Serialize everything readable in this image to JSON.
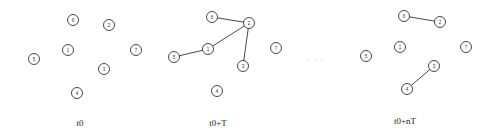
{
  "diagram": {
    "ellipsis": "· · ·",
    "ellipsis_pos": [
      316,
      61
    ],
    "node_radius": 5.5,
    "colors": {
      "stroke": "#333333",
      "fill": "#ffffff",
      "text": "#222222"
    },
    "panels": [
      {
        "label": "t0",
        "label_pos": [
          80,
          126
        ],
        "nodes": [
          {
            "id": "1",
            "x": 68,
            "y": 50
          },
          {
            "id": "2",
            "x": 109,
            "y": 25
          },
          {
            "id": "3",
            "x": 104,
            "y": 69
          },
          {
            "id": "4",
            "x": 77,
            "y": 93
          },
          {
            "id": "5",
            "x": 34,
            "y": 59
          },
          {
            "id": "6",
            "x": 73,
            "y": 20
          },
          {
            "id": "7",
            "x": 136,
            "y": 50
          }
        ],
        "edges": []
      },
      {
        "label": "t0+T",
        "label_pos": [
          218,
          126
        ],
        "nodes": [
          {
            "id": "1",
            "x": 208,
            "y": 49
          },
          {
            "id": "2",
            "x": 249,
            "y": 23
          },
          {
            "id": "3",
            "x": 243,
            "y": 66
          },
          {
            "id": "4",
            "x": 217,
            "y": 91
          },
          {
            "id": "5",
            "x": 174,
            "y": 57
          },
          {
            "id": "6",
            "x": 212,
            "y": 17
          },
          {
            "id": "7",
            "x": 276,
            "y": 48
          }
        ],
        "edges": [
          [
            "6",
            "2"
          ],
          [
            "2",
            "1"
          ],
          [
            "1",
            "5"
          ],
          [
            "2",
            "3"
          ]
        ]
      },
      {
        "label": "t0+nT",
        "label_pos": [
          405,
          124
        ],
        "nodes": [
          {
            "id": "1",
            "x": 400,
            "y": 47
          },
          {
            "id": "2",
            "x": 440,
            "y": 22
          },
          {
            "id": "3",
            "x": 434,
            "y": 66
          },
          {
            "id": "4",
            "x": 407,
            "y": 89
          },
          {
            "id": "5",
            "x": 366,
            "y": 56
          },
          {
            "id": "6",
            "x": 404,
            "y": 16
          },
          {
            "id": "7",
            "x": 466,
            "y": 47
          }
        ],
        "edges": [
          [
            "6",
            "2"
          ],
          [
            "3",
            "4"
          ]
        ]
      }
    ]
  }
}
